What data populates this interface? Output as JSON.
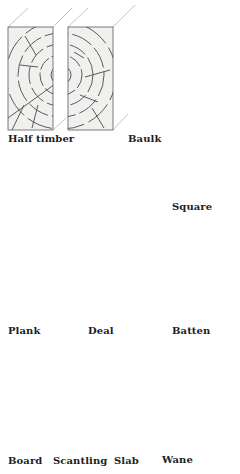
{
  "diagram": {
    "colors": {
      "background": "#ffffff",
      "face_fill": "#f0f0ef",
      "outline": "#5a5a5a",
      "grain": "#4a4a4a",
      "projection": "#9a9a9a",
      "label": "#1e1e1e"
    },
    "labels": {
      "half_timber": "Half timber",
      "baulk": "Baulk",
      "square": "Square",
      "plank": "Plank",
      "deal": "Deal",
      "batten": "Batten",
      "board": "Board",
      "scantling": "Scantling",
      "slab": "Slab",
      "wane": "Wane"
    }
  }
}
